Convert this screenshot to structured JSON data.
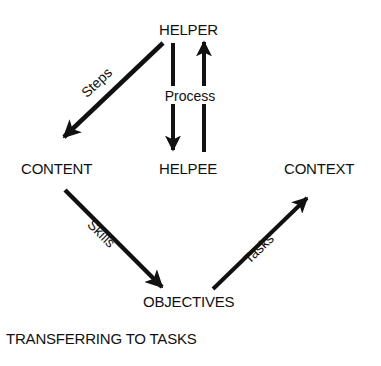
{
  "nodes": {
    "helper": "HELPER",
    "helpee": "HELPEE",
    "content": "CONTENT",
    "context": "CONTEXT",
    "objectives": "OBJECTIVES"
  },
  "edges": {
    "steps": "Steps",
    "process": "Process",
    "skills": "Skills",
    "tasks": "Tasks"
  },
  "caption": "TRANSFERRING TO TASKS",
  "colors": {
    "ink": "#111111",
    "background": "#ffffff"
  }
}
